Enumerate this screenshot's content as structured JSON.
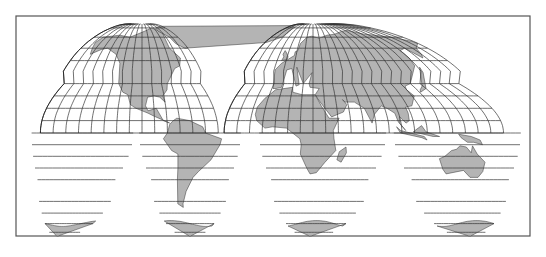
{
  "map": {
    "title": "World map — interrupted Goode homolosine projection",
    "projection": "interrupted-homolosine",
    "colors": {
      "land": "#b4b4b4",
      "water": "#ffffff",
      "lines": "#333333",
      "frame": "#555555"
    },
    "frame": {
      "x": 16,
      "y": 16,
      "width": 514,
      "height": 220
    },
    "equator_y": 133,
    "parallel_spacing_px": 20,
    "north_lobes": [
      {
        "name": "americas-north",
        "x0": 30,
        "x1": 262,
        "cx": 142
      },
      {
        "name": "eurasia-africa-north",
        "x0": 262,
        "x1": 516,
        "cx": 313
      }
    ],
    "south_lobes": [
      {
        "name": "pacific-south-west",
        "x0": 24,
        "x1": 138,
        "cx": 57
      },
      {
        "name": "south-america",
        "x0": 138,
        "x1": 245,
        "cx": 190
      },
      {
        "name": "africa-south",
        "x0": 245,
        "x1": 383,
        "cx": 310
      },
      {
        "name": "australia-south",
        "x0": 383,
        "x1": 516,
        "cx": 470
      }
    ],
    "regions": [
      "North America",
      "South America",
      "Europe",
      "Africa",
      "Asia",
      "Australia",
      "Antarctica"
    ]
  }
}
